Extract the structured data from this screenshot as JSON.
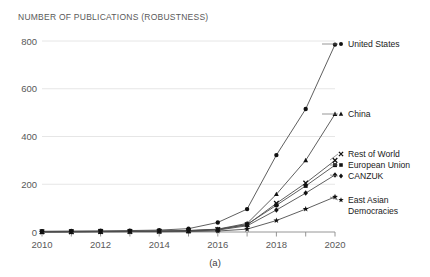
{
  "chart_data": {
    "type": "line",
    "title": "NUMBER OF PUBLICATIONS (ROBUSTNESS)",
    "caption": "(a)",
    "xlabel": "",
    "ylabel": "",
    "xlim": [
      2010,
      2020
    ],
    "ylim": [
      0,
      800
    ],
    "yticks": [
      0,
      200,
      400,
      600,
      800
    ],
    "xticks": [
      2010,
      2012,
      2014,
      2016,
      2018,
      2020
    ],
    "xticks_minor": [
      2011,
      2013,
      2015,
      2017,
      2019
    ],
    "grid": true,
    "legend_position": "right-inline",
    "x": [
      2010,
      2011,
      2012,
      2013,
      2014,
      2015,
      2016,
      2017,
      2018,
      2019,
      2020
    ],
    "series": [
      {
        "name": "United States",
        "marker": "circle",
        "values": [
          3,
          4,
          5,
          6,
          8,
          14,
          40,
          96,
          322,
          515,
          785
        ]
      },
      {
        "name": "China",
        "marker": "triangle",
        "values": [
          1,
          2,
          2,
          3,
          4,
          6,
          12,
          36,
          158,
          300,
          494
        ]
      },
      {
        "name": "Rest of World",
        "marker": "x",
        "values": [
          1,
          1,
          2,
          2,
          3,
          5,
          10,
          30,
          120,
          205,
          300
        ]
      },
      {
        "name": "European Union",
        "marker": "square",
        "values": [
          1,
          2,
          2,
          3,
          4,
          6,
          11,
          32,
          112,
          193,
          280
        ]
      },
      {
        "name": "CANZUK",
        "marker": "diamond",
        "values": [
          1,
          1,
          1,
          2,
          3,
          4,
          8,
          26,
          92,
          163,
          239
        ]
      },
      {
        "name": "East Asian Democracies",
        "marker": "star",
        "values": [
          0,
          0,
          1,
          1,
          1,
          2,
          4,
          12,
          48,
          96,
          147
        ]
      }
    ]
  },
  "legend": {
    "entries": [
      {
        "label": "United States",
        "marker": "circle"
      },
      {
        "label": "China",
        "marker": "triangle"
      },
      {
        "label": "Rest of World",
        "marker": "x"
      },
      {
        "label": "European Union",
        "marker": "square"
      },
      {
        "label": "CANZUK",
        "marker": "diamond"
      },
      {
        "label": "East Asian",
        "label2": "Democracies",
        "marker": "star"
      }
    ]
  },
  "axis_text": {
    "y0": "0",
    "y200": "200",
    "y400": "400",
    "y600": "600",
    "y800": "800",
    "x2010": "2010",
    "x2012": "2012",
    "x2014": "2014",
    "x2016": "2016",
    "x2018": "2018",
    "x2020": "2020"
  },
  "colors": {
    "text": "#404040",
    "title": "#595959",
    "grid": "#e0e0e0",
    "axis": "#8a8a8a",
    "line": "#4d4d4d",
    "marker": "#111111"
  }
}
